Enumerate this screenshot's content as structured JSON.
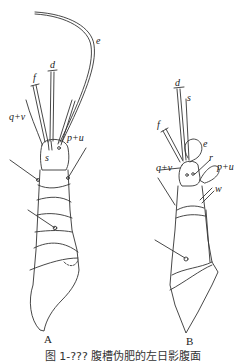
{
  "figure": {
    "panels": [
      {
        "id": "A",
        "label": "A",
        "setae_labels": {
          "e": "e",
          "d": "d",
          "f": "f",
          "qv": "q+v",
          "pu": "p+u",
          "s": "s"
        }
      },
      {
        "id": "B",
        "label": "B",
        "setae_labels": {
          "d": "d",
          "s": "s",
          "f": "f",
          "e": "e",
          "r": "r",
          "qv": "q+v",
          "pu": "p+u",
          "w": "w"
        }
      }
    ],
    "caption": "图 1-??? 腹槽伪肥的左日影腹面"
  }
}
